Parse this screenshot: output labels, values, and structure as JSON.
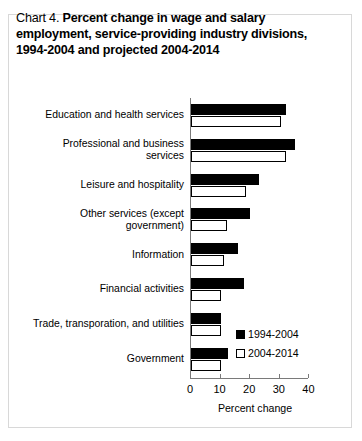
{
  "title": {
    "lead": "Chart 4.",
    "line1_strong": "Percent change in wage and salary",
    "line2": "employment, service-providing industry divisions,",
    "line3": "1994-2004 and projected 2004-2014"
  },
  "legend": {
    "items": [
      {
        "label": "1994-2004",
        "swatch": "filled-black-square"
      },
      {
        "label": "2004-2014",
        "swatch": "open-white-square"
      }
    ]
  },
  "chart_data": {
    "type": "bar",
    "orientation": "horizontal",
    "title": "Chart 4. Percent change in wage and salary employment, service-providing industry divisions, 1994-2004 and projected 2004-2014",
    "xlabel": "Percent change",
    "ylabel": "",
    "xlim": [
      0,
      40
    ],
    "xticks": [
      0,
      10,
      20,
      30,
      40
    ],
    "xtick_labels": [
      "0",
      "10",
      "20",
      "30",
      "40"
    ],
    "grid": false,
    "legend_position": "bottom-right",
    "categories": [
      "Education and health services",
      "Professional and business\nservices",
      "Leisure and hospitality",
      "Other services (except\ngovernment)",
      "Information",
      "Financial activities",
      "Trade, transporation, and utilities",
      "Government"
    ],
    "series": [
      {
        "name": "1994-2004",
        "color": "#000000",
        "values": [
          32.0,
          35.0,
          23.0,
          20.0,
          16.0,
          18.0,
          10.0,
          12.5
        ]
      },
      {
        "name": "2004-2014",
        "color": "#ffffff",
        "values": [
          30.5,
          32.0,
          18.5,
          12.0,
          11.0,
          10.0,
          10.0,
          10.0
        ]
      }
    ]
  }
}
